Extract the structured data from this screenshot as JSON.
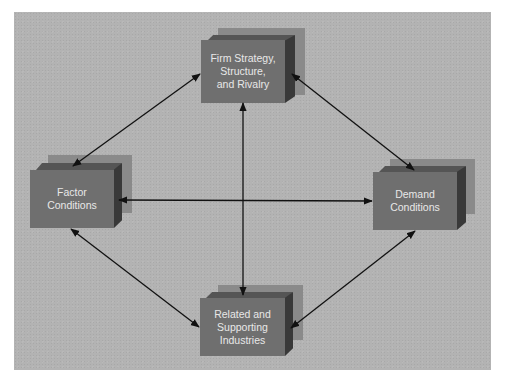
{
  "diagram": {
    "colors": {
      "background": "#b3b3b3",
      "box_front": "#6f6f6f",
      "box_top": "#555555",
      "box_side": "#393939",
      "box_shadow": "#8a8a8a",
      "text": "#e8e8e8",
      "arrow": "#111111"
    },
    "nodes": {
      "top": {
        "lines": [
          "Firm Strategy,",
          "Structure,",
          "and Rivalry"
        ]
      },
      "left": {
        "lines": [
          "Factor",
          "Conditions"
        ]
      },
      "right": {
        "lines": [
          "Demand",
          "Conditions"
        ]
      },
      "bottom": {
        "lines": [
          "Related and",
          "Supporting",
          "Industries"
        ]
      }
    },
    "edges": [
      {
        "from": "top",
        "to": "left",
        "type": "bidirectional"
      },
      {
        "from": "top",
        "to": "right",
        "type": "bidirectional"
      },
      {
        "from": "top",
        "to": "bottom",
        "type": "bidirectional"
      },
      {
        "from": "left",
        "to": "right",
        "type": "bidirectional"
      },
      {
        "from": "left",
        "to": "bottom",
        "type": "bidirectional"
      },
      {
        "from": "right",
        "to": "bottom",
        "type": "bidirectional"
      }
    ]
  }
}
